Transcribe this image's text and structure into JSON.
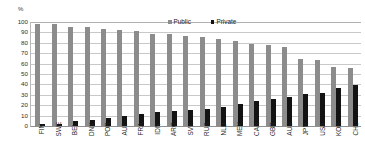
{
  "chart_data": {
    "type": "bar",
    "title": "",
    "subtitle": "",
    "xlabel": "",
    "ylabel": "",
    "yunit": "%",
    "ylim": [
      0,
      100
    ],
    "yticks": [
      100,
      90,
      80,
      70,
      60,
      50,
      40,
      30,
      20,
      10,
      0
    ],
    "grid": true,
    "legend_position": "top-center",
    "categories": [
      "FIN",
      "SWE",
      "BEL",
      "DNK",
      "POR",
      "AUT",
      "FRA",
      "IDN",
      "ARG",
      "SVK",
      "RUS",
      "NLD",
      "MEX",
      "CAN",
      "GBR",
      "AUS",
      "JPN",
      "USA",
      "KOR",
      "CHL"
    ],
    "series": [
      {
        "name": "Public",
        "color": "#8c8c8c",
        "values": [
          98,
          98,
          95,
          95,
          93,
          92,
          91,
          88,
          88,
          87,
          86,
          84,
          82,
          79,
          78,
          76,
          64,
          63,
          57,
          56
        ]
      },
      {
        "name": "Private",
        "color": "#131313",
        "values": [
          2,
          2,
          5,
          5.5,
          8,
          10,
          11.5,
          13,
          14,
          15,
          16,
          18.5,
          21,
          24,
          25.5,
          28,
          31,
          32,
          36.5,
          39
        ]
      }
    ]
  },
  "legend": {
    "items": [
      {
        "label": "Public",
        "color": "#8c8c8c"
      },
      {
        "label": "Private",
        "color": "#131313"
      }
    ]
  },
  "axes": {
    "y_unit": "%"
  }
}
